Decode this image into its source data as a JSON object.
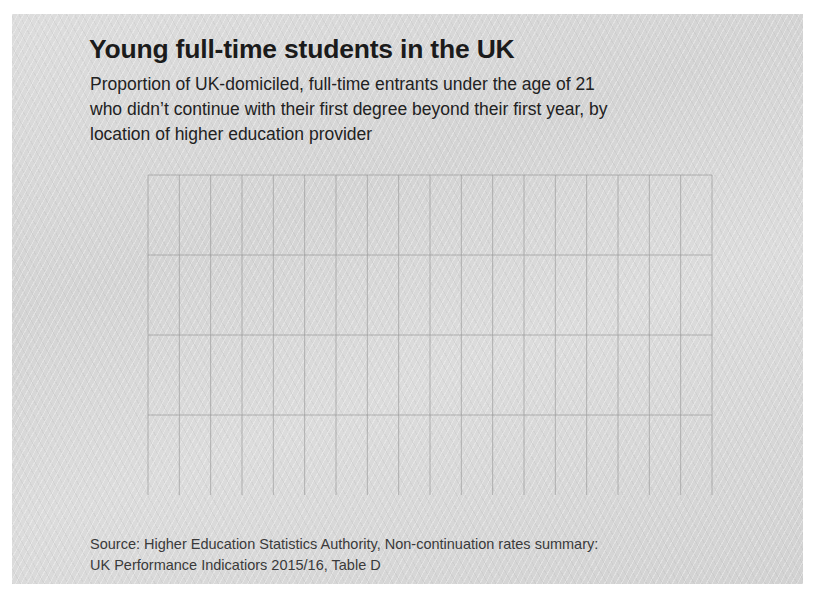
{
  "header": {
    "title": "Young full-time students in the UK",
    "subtitle_lines": [
      "Proportion of UK-domiciled, full-time entrants under the age of 21",
      "who didn’t continue with their first degree beyond their first year, by",
      "location of higher education provider"
    ]
  },
  "source": {
    "line1": "Source: Higher Education Statistics Authority, Non-continuation rates summary:",
    "line2": "UK Performance Indicatiors 2015/16, Table D"
  },
  "legend": {
    "items": [
      {
        "label": "Scotland",
        "color": "#4a4a4a"
      },
      {
        "label": "Northern Ireland",
        "color": "#5a5a5a"
      },
      {
        "label": "Wales",
        "color": "#6a6a6a"
      },
      {
        "label": "England",
        "color": "#787878"
      }
    ]
  },
  "chart_data": {
    "type": "line",
    "title": "Young full-time students in the UK",
    "subtitle": "Proportion of UK-domiciled, full-time entrants under the age of 21 who didn’t continue with their first degree beyond their first year, by location of higher education provider",
    "xlabel": "",
    "ylabel": "",
    "ylim": [
      0,
      12
    ],
    "yticks": [
      0,
      3,
      6,
      9,
      12
    ],
    "ytick_labels": [
      "0%",
      "3%",
      "6%",
      "9%",
      "12%"
    ],
    "grid": true,
    "legend_position": "inside-bottom-left",
    "x": [
      "1997/98",
      "1998/99",
      "1999/00",
      "2000/01",
      "2001/02",
      "2002/03",
      "2003/04",
      "2004/05",
      "2005/06",
      "2006/07",
      "2007/08",
      "2008/09",
      "2009/10",
      "2010/11",
      "2011/12",
      "2012/13",
      "2013/14",
      "2014/15",
      "2015/16"
    ],
    "xtick_labels": [
      "1997/98",
      "2002/03",
      "2007/08",
      "2012/13"
    ],
    "xtick_indices": [
      0,
      5,
      10,
      15
    ],
    "series": [
      {
        "name": "Scotland",
        "color": "#4a4a4a",
        "values": [
          6.9,
          7.6,
          9.1,
          8.7,
          10.6,
          9.9,
          11.2,
          10.1,
          10.9,
          9.5,
          8.9,
          10.0,
          9.4,
          8.2,
          7.6,
          6.4,
          6.2,
          6.1,
          5.3
        ]
      },
      {
        "name": "Northern Ireland",
        "color": "#5a5a5a",
        "values": [
          7.9,
          6.5,
          6.9,
          6.8,
          9.6,
          10.5,
          9.6,
          9.2,
          8.8,
          9.1,
          8.9,
          8.2,
          7.8,
          7.3,
          6.6,
          5.7,
          5.6,
          6.0,
          6.2
        ]
      },
      {
        "name": "Wales",
        "color": "#6a6a6a",
        "values": [
          7.7,
          7.9,
          7.0,
          7.1,
          7.4,
          7.2,
          7.8,
          8.5,
          8.0,
          8.6,
          8.9,
          7.6,
          6.1,
          7.6,
          7.6,
          5.5,
          5.4,
          5.9,
          6.1
        ]
      },
      {
        "name": "England",
        "color": "#787878",
        "values": [
          7.6,
          7.6,
          6.9,
          6.8,
          7.0,
          7.1,
          6.7,
          6.8,
          6.9,
          7.1,
          6.9,
          6.5,
          6.2,
          5.8,
          5.9,
          6.1,
          6.2,
          6.4,
          6.2
        ]
      }
    ]
  },
  "axes": {
    "y_labels": [
      "12%",
      "9%",
      "6%",
      "3%",
      "0%"
    ],
    "x_labels": [
      "1997/98",
      "2002/03",
      "2007/08",
      "2012/13"
    ]
  }
}
